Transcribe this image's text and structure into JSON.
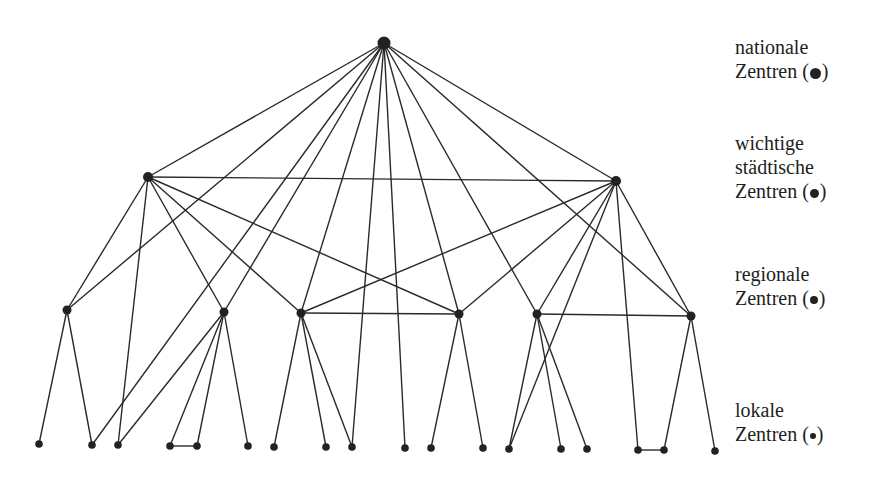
{
  "legend": [
    {
      "key": "national",
      "lines": [
        "nationale",
        "Zentren (●)"
      ],
      "line1": "nationale",
      "line2": "Zentren (",
      "line3": "",
      "close": ")",
      "top": 35,
      "dot_size": 10
    },
    {
      "key": "wichtig",
      "line1": "wichtige",
      "line2": "städtische",
      "line3": "Zentren (",
      "close": ")",
      "top": 131,
      "dot_size": 8
    },
    {
      "key": "regional",
      "line1": "regionale",
      "line2": "Zentren (",
      "line3": "",
      "close": ")",
      "top": 262,
      "dot_size": 7
    },
    {
      "key": "lokal",
      "line1": "lokale",
      "line2": "Zentren (",
      "line3": "",
      "close": ")",
      "top": 398,
      "dot_size": 6
    }
  ],
  "nodes": {
    "N": {
      "level": "national",
      "x": 384,
      "y": 43,
      "r": 6.5
    },
    "W1": {
      "level": "wichtig",
      "x": 148,
      "y": 177,
      "r": 5
    },
    "W2": {
      "level": "wichtig",
      "x": 616,
      "y": 181,
      "r": 5
    },
    "R1": {
      "level": "regional",
      "x": 67,
      "y": 310,
      "r": 4.5
    },
    "R2": {
      "level": "regional",
      "x": 224,
      "y": 312,
      "r": 4.5
    },
    "R3": {
      "level": "regional",
      "x": 301,
      "y": 313,
      "r": 4.5
    },
    "R4": {
      "level": "regional",
      "x": 459,
      "y": 314,
      "r": 4.5
    },
    "R5": {
      "level": "regional",
      "x": 537,
      "y": 314,
      "r": 4.5
    },
    "R6": {
      "level": "regional",
      "x": 691,
      "y": 316,
      "r": 4.5
    },
    "L1": {
      "level": "lokal",
      "x": 39,
      "y": 444,
      "r": 3.8
    },
    "L2": {
      "level": "lokal",
      "x": 92,
      "y": 445,
      "r": 3.8
    },
    "L3": {
      "level": "lokal",
      "x": 118,
      "y": 445,
      "r": 3.8
    },
    "L4": {
      "level": "lokal",
      "x": 170,
      "y": 446,
      "r": 3.8
    },
    "L5": {
      "level": "lokal",
      "x": 197,
      "y": 446,
      "r": 3.8
    },
    "L6": {
      "level": "lokal",
      "x": 248,
      "y": 446,
      "r": 3.8
    },
    "L7": {
      "level": "lokal",
      "x": 274,
      "y": 447,
      "r": 3.8
    },
    "L8": {
      "level": "lokal",
      "x": 326,
      "y": 447,
      "r": 3.8
    },
    "L9": {
      "level": "lokal",
      "x": 352,
      "y": 447,
      "r": 3.8
    },
    "L10": {
      "level": "lokal",
      "x": 405,
      "y": 448,
      "r": 3.8
    },
    "L11": {
      "level": "lokal",
      "x": 431,
      "y": 448,
      "r": 3.8
    },
    "L12": {
      "level": "lokal",
      "x": 483,
      "y": 448,
      "r": 3.8
    },
    "L13": {
      "level": "lokal",
      "x": 509,
      "y": 449,
      "r": 3.8
    },
    "L14": {
      "level": "lokal",
      "x": 561,
      "y": 449,
      "r": 3.8
    },
    "L15": {
      "level": "lokal",
      "x": 587,
      "y": 449,
      "r": 3.8
    },
    "L16": {
      "level": "lokal",
      "x": 638,
      "y": 450,
      "r": 3.8
    },
    "L17": {
      "level": "lokal",
      "x": 664,
      "y": 450,
      "r": 3.8
    },
    "L18": {
      "level": "lokal",
      "x": 715,
      "y": 451,
      "r": 3.8
    }
  },
  "edges": [
    [
      "N",
      "W1"
    ],
    [
      "N",
      "W2"
    ],
    [
      "N",
      "R1"
    ],
    [
      "N",
      "L2"
    ],
    [
      "N",
      "R2"
    ],
    [
      "N",
      "R3"
    ],
    [
      "N",
      "L9"
    ],
    [
      "N",
      "L10"
    ],
    [
      "N",
      "R4"
    ],
    [
      "N",
      "R5"
    ],
    [
      "N",
      "R6"
    ],
    [
      "W1",
      "W2"
    ],
    [
      "W1",
      "R1"
    ],
    [
      "W1",
      "L3"
    ],
    [
      "W1",
      "R2"
    ],
    [
      "W1",
      "R3"
    ],
    [
      "W1",
      "R4"
    ],
    [
      "W2",
      "R3"
    ],
    [
      "W2",
      "R4"
    ],
    [
      "W2",
      "R5"
    ],
    [
      "W2",
      "L13"
    ],
    [
      "W2",
      "L16"
    ],
    [
      "W2",
      "R6"
    ],
    [
      "R1",
      "L1"
    ],
    [
      "R1",
      "L2"
    ],
    [
      "R2",
      "L3"
    ],
    [
      "R2",
      "L4"
    ],
    [
      "R2",
      "L5"
    ],
    [
      "R2",
      "L6"
    ],
    [
      "R3",
      "L7"
    ],
    [
      "R3",
      "L8"
    ],
    [
      "R3",
      "L9"
    ],
    [
      "R3",
      "R4"
    ],
    [
      "R4",
      "L11"
    ],
    [
      "R4",
      "L12"
    ],
    [
      "R5",
      "L13"
    ],
    [
      "R5",
      "L14"
    ],
    [
      "R5",
      "L15"
    ],
    [
      "R5",
      "R6"
    ],
    [
      "R6",
      "L17"
    ],
    [
      "R6",
      "L18"
    ],
    [
      "L4",
      "L5"
    ],
    [
      "L16",
      "L17"
    ]
  ]
}
